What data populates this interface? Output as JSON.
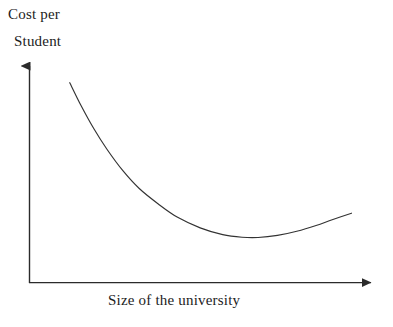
{
  "chart_data": {
    "type": "line",
    "title": "",
    "subtitle": "",
    "xlabel": "Size of the university",
    "ylabel_line1": "Cost per",
    "ylabel_line2": "Student",
    "ylabel_full": "Cost per Student",
    "legend": [],
    "annotations": [],
    "grid": false,
    "axis_style": "arrow-tipped L-shaped axes, no tick marks, no tick labels",
    "xticks": [],
    "yticks": [],
    "xlim": [
      0,
      1
    ],
    "ylim": [
      0,
      1
    ],
    "series": [
      {
        "name": "Average cost per student",
        "shape": "U-shaped long-run average cost curve",
        "color": "#333333",
        "points": [
          {
            "x": 0.125,
            "y": 0.763
          },
          {
            "x": 0.16,
            "y": 0.676
          },
          {
            "x": 0.2,
            "y": 0.587
          },
          {
            "x": 0.24,
            "y": 0.51
          },
          {
            "x": 0.29,
            "y": 0.427
          },
          {
            "x": 0.34,
            "y": 0.36
          },
          {
            "x": 0.4,
            "y": 0.3
          },
          {
            "x": 0.46,
            "y": 0.249
          },
          {
            "x": 0.53,
            "y": 0.209
          },
          {
            "x": 0.6,
            "y": 0.183
          },
          {
            "x": 0.66,
            "y": 0.173
          },
          {
            "x": 0.71,
            "y": 0.172
          },
          {
            "x": 0.77,
            "y": 0.18
          },
          {
            "x": 0.83,
            "y": 0.196
          },
          {
            "x": 0.89,
            "y": 0.218
          },
          {
            "x": 0.94,
            "y": 0.24
          },
          {
            "x": 1.0,
            "y": 0.265
          }
        ],
        "minimum_point": {
          "x": 0.69,
          "y": 0.171,
          "meaning": "minimum efficient scale"
        }
      }
    ]
  },
  "colors": {
    "background": "#ffffff",
    "axis": "#2b2b2b",
    "curve": "#333333",
    "text": "#1c1c1c"
  }
}
